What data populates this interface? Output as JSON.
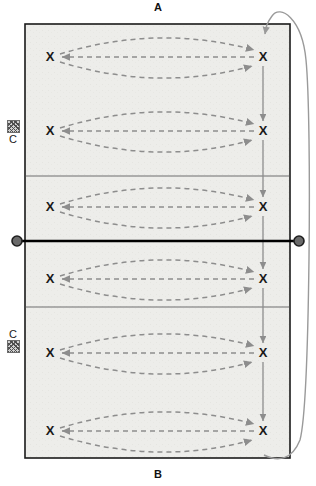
{
  "diagram": {
    "type": "volleyball-court-drill",
    "title_top": "A",
    "title_bottom": "B",
    "court": {
      "fill_color": "#ededea",
      "border_color": "#1a1a1a",
      "attack_line_color": "#6e6e6e",
      "net_color": "#000000",
      "left": 25,
      "top": 24,
      "width": 265,
      "height": 434
    },
    "net": {
      "y": 241,
      "post_color": "#555555",
      "post_ring_color": "#2a2a2a",
      "label": "net"
    },
    "attack_lines": [
      {
        "y": 176,
        "label": "attack-line-top"
      },
      {
        "y": 307,
        "label": "attack-line-bottom"
      }
    ],
    "player_marker": "X",
    "player_rows": [
      {
        "id": "row-1",
        "y": 57,
        "left_x": 50,
        "right_x": 263
      },
      {
        "id": "row-2",
        "y": 131,
        "left_x": 50,
        "right_x": 263
      },
      {
        "id": "row-3",
        "y": 207,
        "left_x": 50,
        "right_x": 263
      },
      {
        "id": "row-4",
        "y": 279,
        "left_x": 50,
        "right_x": 263
      },
      {
        "id": "row-5",
        "y": 353,
        "left_x": 50,
        "right_x": 263
      },
      {
        "id": "row-6",
        "y": 431,
        "left_x": 50,
        "right_x": 263
      }
    ],
    "ball_carts": [
      {
        "id": "cart-top",
        "label": "C",
        "label_position": "below",
        "x": 13,
        "y": 127
      },
      {
        "id": "cart-bottom",
        "label": "C",
        "label_position": "above",
        "x": 13,
        "y": 349
      }
    ],
    "paths": {
      "ball_path_color": "#8d8d8d",
      "ball_path_style": "dashed",
      "movement_arrow_color": "#8d8d8d",
      "rotation_curve_color": "#9a9a9a",
      "rotation_arrow_label": "rotation-loop"
    },
    "movement_arrows": [
      {
        "id": "arrow-1-2",
        "x": 263,
        "from_y": 66,
        "to_y": 124
      },
      {
        "id": "arrow-2-3",
        "x": 263,
        "from_y": 140,
        "to_y": 200
      },
      {
        "id": "arrow-3-4",
        "x": 263,
        "from_y": 216,
        "to_y": 272
      },
      {
        "id": "arrow-4-5",
        "x": 263,
        "from_y": 288,
        "to_y": 346
      },
      {
        "id": "arrow-5-6",
        "x": 263,
        "from_y": 362,
        "to_y": 424
      }
    ]
  }
}
